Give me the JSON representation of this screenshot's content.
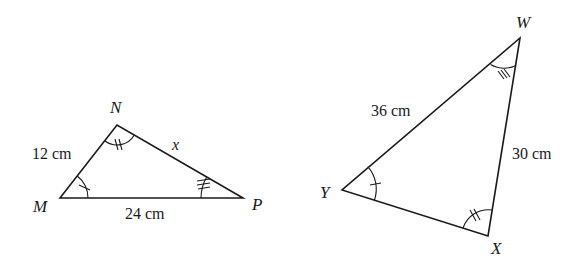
{
  "triangles": [
    {
      "name": "MNP",
      "vertices": {
        "M": {
          "label": "M",
          "x": 60,
          "y": 198
        },
        "N": {
          "label": "N",
          "x": 117,
          "y": 125
        },
        "P": {
          "label": "P",
          "x": 243,
          "y": 198
        }
      },
      "sides": {
        "MN": {
          "label": "12 cm"
        },
        "NP": {
          "label": "x"
        },
        "MP": {
          "label": "24 cm"
        }
      },
      "angle_marks": {
        "M": {
          "ticks": 1
        },
        "N": {
          "ticks": 2
        },
        "P": {
          "ticks": 3
        }
      }
    },
    {
      "name": "WXY",
      "vertices": {
        "W": {
          "label": "W",
          "x": 520,
          "y": 38
        },
        "X": {
          "label": "X",
          "x": 488,
          "y": 236
        },
        "Y": {
          "label": "Y",
          "x": 342,
          "y": 190
        }
      },
      "sides": {
        "YW": {
          "label": "36 cm"
        },
        "WX": {
          "label": "30 cm"
        },
        "YX": {
          "label": ""
        }
      },
      "angle_marks": {
        "Y": {
          "ticks": 1
        },
        "X": {
          "ticks": 2
        },
        "W": {
          "ticks": 3
        }
      }
    }
  ],
  "colors": {
    "stroke": "#1a1a1a",
    "background": "#ffffff"
  }
}
